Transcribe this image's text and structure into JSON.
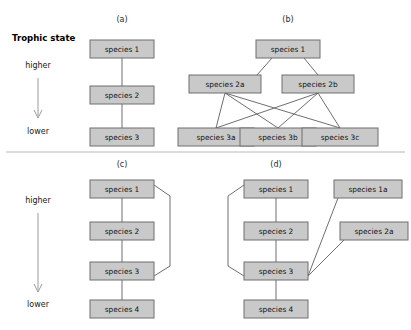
{
  "axis": {
    "title": "Trophic state",
    "higher_label": "higher",
    "lower_label": "lower",
    "arrow_icon": "down-arrow-icon"
  },
  "panels": {
    "a": {
      "label": "(a)",
      "nodes": [
        {
          "id": "a1",
          "label": "species 1"
        },
        {
          "id": "a2",
          "label": "species 2"
        },
        {
          "id": "a3",
          "label": "species 3"
        }
      ]
    },
    "b": {
      "label": "(b)",
      "nodes": [
        {
          "id": "b1",
          "label": "species 1"
        },
        {
          "id": "b2a",
          "label": "species 2a"
        },
        {
          "id": "b2b",
          "label": "species 2b"
        },
        {
          "id": "b3a",
          "label": "species 3a"
        },
        {
          "id": "b3b",
          "label": "species 3b"
        },
        {
          "id": "b3c",
          "label": "species 3c"
        }
      ]
    },
    "c": {
      "label": "(c)",
      "nodes": [
        {
          "id": "c1",
          "label": "species 1"
        },
        {
          "id": "c2",
          "label": "species 2"
        },
        {
          "id": "c3",
          "label": "species 3"
        },
        {
          "id": "c4",
          "label": "species 4"
        }
      ]
    },
    "d": {
      "label": "(d)",
      "nodes": [
        {
          "id": "d1",
          "label": "species 1"
        },
        {
          "id": "d2",
          "label": "species 2"
        },
        {
          "id": "d3",
          "label": "species 3"
        },
        {
          "id": "d4",
          "label": "species 4"
        },
        {
          "id": "d1a",
          "label": "species 1a"
        },
        {
          "id": "d2a",
          "label": "species 2a"
        }
      ]
    }
  },
  "colors": {
    "node_fill": "#c9c9c9",
    "node_border": "#6e6e6e",
    "link": "#5d5d5d",
    "axis_arrow": "#9a9a9a",
    "divider": "#b9b9b9",
    "background": "#ffffff"
  }
}
